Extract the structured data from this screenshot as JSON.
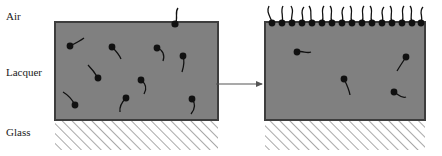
{
  "figure": {
    "type": "schematic-diagram",
    "width": 442,
    "height": 156,
    "background_color": "#ffffff"
  },
  "labels": [
    {
      "id": "air",
      "text": "Air",
      "x": 6,
      "y": 20
    },
    {
      "id": "lacquer",
      "text": "Lacquer",
      "x": 6,
      "y": 76
    },
    {
      "id": "glass",
      "text": "Glass",
      "x": 6,
      "y": 136
    }
  ],
  "colors": {
    "lacquer_fill": "#808080",
    "lacquer_border": "#3d3d3d",
    "glass_hatch": "#8c8c8c",
    "molecule": "#111111",
    "arrow": "#555555",
    "label_text": "#1a1a1a",
    "background": "#ffffff"
  },
  "panels": [
    {
      "id": "before",
      "name": "left-panel",
      "caption": "",
      "lacquer": {
        "x": 55,
        "y": 22,
        "width": 163,
        "height": 98
      },
      "glass": {
        "x": 55,
        "y": 120,
        "width": 163,
        "height": 30
      },
      "surface_molecules_count": 0,
      "bulk_molecules_count": 9,
      "escaping_molecules_count": 1
    },
    {
      "id": "after",
      "name": "right-panel",
      "caption": "",
      "lacquer": {
        "x": 265,
        "y": 22,
        "width": 160,
        "height": 98
      },
      "glass": {
        "x": 265,
        "y": 120,
        "width": 160,
        "height": 30
      },
      "surface_molecules_count": 16,
      "bulk_molecules_count": 4,
      "escaping_molecules_count": 0
    }
  ],
  "arrow": {
    "name": "process-arrow",
    "x1": 216,
    "y1": 84,
    "x2": 264,
    "y2": 84,
    "head_size": 5
  },
  "molecule_style": {
    "head_radius": 3.4,
    "tail_width": 1.3,
    "description": "black circular head with curved filament tail"
  },
  "left_bulk_molecules": [
    {
      "hx": 70,
      "hy": 46,
      "tail": "M70,46 C76,43 80,41 84,38"
    },
    {
      "hx": 112,
      "hy": 47,
      "tail": "M112,47 C116,51 119,54 121,59"
    },
    {
      "hx": 157,
      "hy": 48,
      "tail": "M157,48 C163,50 165,55 163,61"
    },
    {
      "hx": 183,
      "hy": 56,
      "tail": "M183,56 C185,62 184,66 182,72"
    },
    {
      "hx": 98,
      "hy": 78,
      "tail": "M98,78 C95,73 92,69 88,65"
    },
    {
      "hx": 141,
      "hy": 80,
      "tail": "M141,80 C146,84 147,89 144,94"
    },
    {
      "hx": 75,
      "hy": 105,
      "tail": "M75,105 C72,99 68,95 63,92"
    },
    {
      "hx": 126,
      "hy": 98,
      "tail": "M126,98 C122,102 119,106 120,112"
    },
    {
      "hx": 192,
      "hy": 99,
      "tail": "M192,99 C196,104 195,109 191,114"
    }
  ],
  "left_escaping_molecules": [
    {
      "hx": 175,
      "hy": 24,
      "tail": "M175,24 C179,18 174,13 178,8"
    }
  ],
  "right_bulk_molecules": [
    {
      "hx": 297,
      "hy": 52,
      "tail": "M297,52 C303,50 306,54 311,52"
    },
    {
      "hx": 406,
      "hy": 57,
      "tail": "M406,57 C402,63 400,66 397,71"
    },
    {
      "hx": 344,
      "hy": 79,
      "tail": "M344,79 C347,85 349,89 350,95"
    },
    {
      "hx": 394,
      "hy": 92,
      "tail": "M394,92 C399,95 402,99 406,97"
    }
  ],
  "right_surface_molecules": [
    {
      "hx": 272,
      "tail": "M272,22 C270,16 266,12 269,6"
    },
    {
      "hx": 282,
      "tail": "M282,22 C284,16 280,11 283,6"
    },
    {
      "hx": 292,
      "tail": "M292,22 C290,15 295,12 291,6"
    },
    {
      "hx": 302,
      "tail": "M302,22 C305,17 299,12 304,7"
    },
    {
      "hx": 312,
      "tail": "M312,22 C309,16 313,11 309,6"
    },
    {
      "hx": 322,
      "tail": "M322,22 C325,16 320,11 324,6"
    },
    {
      "hx": 332,
      "tail": "M332,22 C329,16 334,11 330,6"
    },
    {
      "hx": 342,
      "tail": "M342,22 C345,17 339,12 344,7"
    },
    {
      "hx": 352,
      "tail": "M352,22 C349,16 354,11 350,6"
    },
    {
      "hx": 362,
      "tail": "M362,22 C365,16 360,11 364,6"
    },
    {
      "hx": 372,
      "tail": "M372,22 C369,16 374,11 370,6"
    },
    {
      "hx": 382,
      "tail": "M382,22 C385,17 379,12 384,7"
    },
    {
      "hx": 392,
      "tail": "M392,22 C389,16 394,11 390,6"
    },
    {
      "hx": 402,
      "tail": "M402,22 C405,16 400,11 404,6"
    },
    {
      "hx": 412,
      "tail": "M412,22 C409,16 414,11 410,6"
    },
    {
      "hx": 421,
      "tail": "M421,22 C424,17 418,12 423,7"
    }
  ]
}
